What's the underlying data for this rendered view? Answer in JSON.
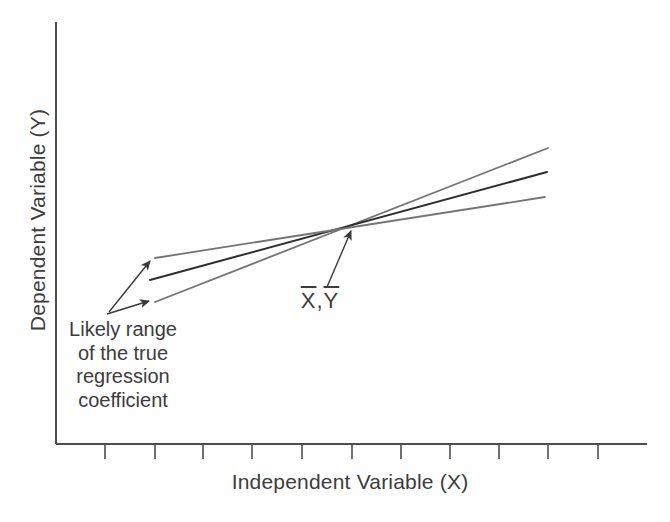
{
  "chart_data": {
    "type": "line",
    "title": "",
    "xlabel": "Independent Variable (X)",
    "ylabel": "Dependent Variable (Y)",
    "grid": false,
    "legend": "none",
    "x_tick_labels": [],
    "y_tick_labels": [],
    "axis_color": "#4d4d4d",
    "arrow_color": "#3a3a3a",
    "axes_px": {
      "origin": [
        56,
        444
      ],
      "x_end": 647,
      "y_top": 22,
      "tick_length": 15,
      "x_tick_positions": [
        105,
        155,
        203,
        252,
        302,
        352,
        401,
        450,
        499,
        548,
        598
      ]
    },
    "pivot_point_px": [
      352,
      226
    ],
    "series": [
      {
        "name": "range-upper-slope-line",
        "role": "likely-range-limit",
        "color": "#747474",
        "width": 1.8,
        "from_px": [
          155,
          302
        ],
        "to_px": [
          548,
          148
        ]
      },
      {
        "name": "estimated-regression-line",
        "role": "fitted-regression-line",
        "color": "#2e2e2e",
        "width": 2,
        "from_px": [
          150,
          280
        ],
        "to_px": [
          547,
          172
        ]
      },
      {
        "name": "range-lower-slope-line",
        "role": "likely-range-limit",
        "color": "#747474",
        "width": 1.8,
        "from_px": [
          155,
          258
        ],
        "to_px": [
          545,
          197
        ]
      }
    ],
    "arrows": [
      {
        "name": "mean-point-arrow",
        "from_px": [
          327,
          287
        ],
        "to_px": [
          351,
          231
        ]
      },
      {
        "name": "range-arrow-upper",
        "from_px": [
          109,
          312
        ],
        "to_px": [
          150,
          261
        ]
      },
      {
        "name": "range-arrow-lower",
        "from_px": [
          107,
          314
        ],
        "to_px": [
          149,
          301
        ]
      }
    ]
  },
  "labels": {
    "mean_point": {
      "x": "X",
      "separator": ",",
      "y": "Y"
    },
    "range_note": {
      "lines": [
        "Likely range",
        "of the true",
        "regression",
        "coefficient"
      ]
    }
  }
}
